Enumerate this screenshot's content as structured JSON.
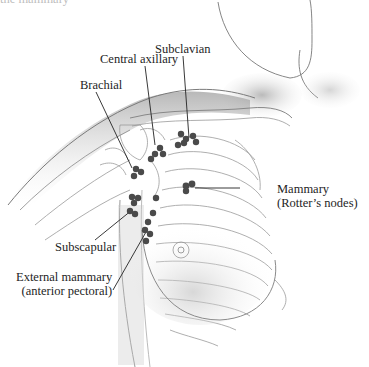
{
  "figure": {
    "title_fragment": "the mammary",
    "colors": {
      "node": "#4a4a4a",
      "leader_line": "#222222",
      "sketch_line": "#8a8a8a",
      "shading": "#b8b8b8"
    }
  },
  "labels": {
    "subclavian": "Subclavian",
    "central_axillary": "Central axillary",
    "brachial": "Brachial",
    "mammary_line1": "Mammary",
    "mammary_line2": "(Rotter’s nodes)",
    "subscapular": "Subscapular",
    "external_mammary_line1": "External mammary",
    "external_mammary_line2": "(anterior pectoral)"
  }
}
